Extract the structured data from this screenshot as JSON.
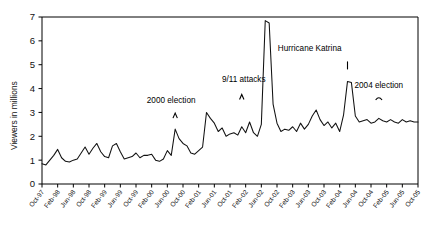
{
  "chart_data": {
    "type": "line",
    "title": "",
    "xlabel": "",
    "ylabel": "Viewers in millions",
    "ylim": [
      0,
      7
    ],
    "ytick_labels": [
      "0",
      "1",
      "2",
      "3",
      "4",
      "5",
      "6",
      "7"
    ],
    "ytick_values": [
      0,
      1,
      2,
      3,
      4,
      5,
      6,
      7
    ],
    "grid": false,
    "legend": "none",
    "xtick_labels": [
      "Oct-97",
      "Feb-98",
      "Jun-98",
      "Oct-98",
      "Feb-99",
      "Jun-99",
      "Oct-99",
      "Feb-00",
      "Jun-00",
      "Oct-00",
      "Feb-01",
      "Jun-01",
      "Oct-01",
      "Feb-02",
      "Jun-02",
      "Oct-02",
      "Feb-03",
      "Jun-03",
      "Oct-03",
      "Feb-04",
      "Jun-04",
      "Oct-04",
      "Feb-05",
      "Jun-05",
      "Oct-05"
    ],
    "xtick_interval_months": 4,
    "x_start": "Oct-97",
    "x_end": "Oct-05",
    "series": [
      {
        "name": "Viewers",
        "values": [
          0.85,
          0.8,
          1.0,
          1.2,
          1.45,
          1.1,
          0.95,
          0.92,
          1.0,
          1.05,
          1.3,
          1.55,
          1.25,
          1.5,
          1.7,
          1.35,
          1.15,
          1.1,
          1.6,
          1.7,
          1.35,
          1.05,
          1.1,
          1.15,
          1.3,
          1.1,
          1.2,
          1.2,
          1.25,
          1.0,
          0.95,
          1.05,
          1.4,
          1.2,
          2.3,
          1.9,
          1.7,
          1.6,
          1.3,
          1.25,
          1.4,
          1.55,
          3.0,
          2.75,
          2.55,
          2.2,
          2.35,
          2.0,
          2.1,
          2.15,
          2.05,
          2.4,
          2.15,
          2.6,
          2.15,
          2.0,
          2.5,
          6.85,
          6.75,
          3.35,
          2.55,
          2.2,
          2.3,
          2.25,
          2.4,
          2.2,
          2.55,
          2.3,
          2.5,
          2.85,
          3.1,
          2.7,
          2.45,
          2.6,
          2.35,
          2.55,
          2.2,
          2.9,
          4.3,
          4.25,
          2.85,
          2.6,
          2.65,
          2.7,
          2.55,
          2.6,
          2.75,
          2.65,
          2.6,
          2.7,
          2.6,
          2.55,
          2.7,
          2.6,
          2.65,
          2.6,
          2.6
        ]
      }
    ],
    "annotations": [
      {
        "label": "2000 election",
        "x_label": "Oct-00",
        "value": 2.3
      },
      {
        "label": "9/11 attacks",
        "x_label": "Oct-01",
        "value": 3.0
      },
      {
        "label": "Invasion of Iraq",
        "x_label": "Mar-03",
        "value": 6.85
      },
      {
        "label": "2004 election",
        "x_label": "Oct-04",
        "value": 3.1
      },
      {
        "label": "Hurricane Katrina",
        "x_label": "Sep-05",
        "value": 4.3
      }
    ]
  },
  "colors": {
    "line": "#111111",
    "axis": "#000000",
    "background": "#ffffff"
  }
}
